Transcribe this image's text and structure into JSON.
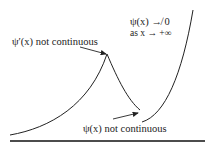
{
  "labels": {
    "derivative_discontinuity": "ψ′(x) not continuous",
    "function_discontinuity": "ψ(x) not continuous",
    "limit_line1": "ψ(x) ↛ 0",
    "limit_line2": "as x → +∞"
  },
  "colors": {
    "curve": "#222222",
    "axis": "#111111",
    "text": "#222222"
  }
}
